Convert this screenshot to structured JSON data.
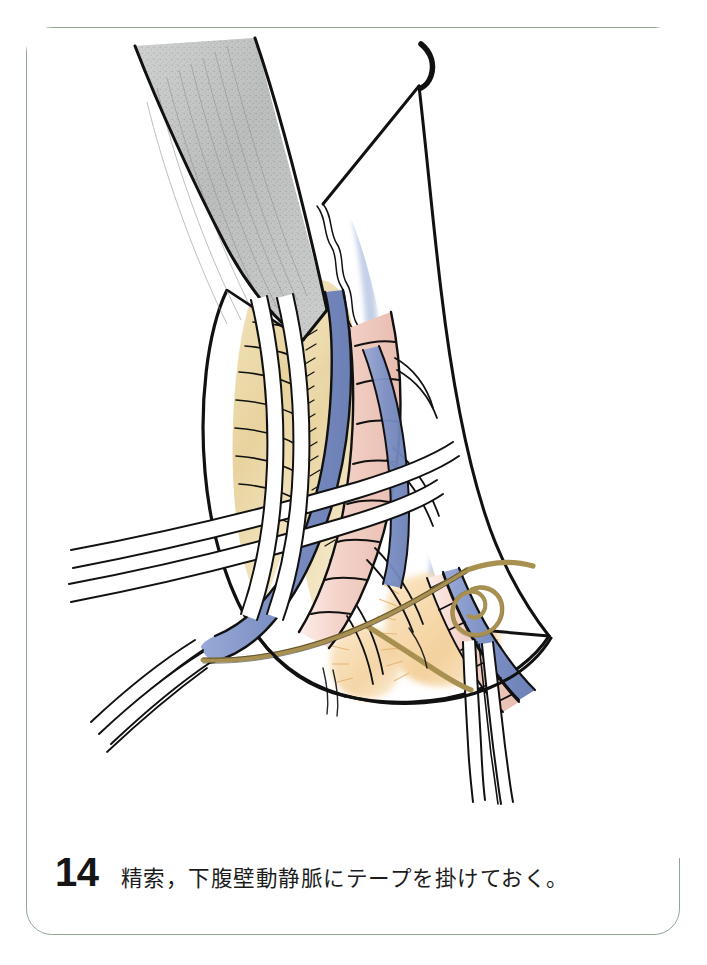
{
  "page": {
    "background_color": "#ffffff",
    "border_color": "#8fa795",
    "card_background": "#ffffff"
  },
  "caption": {
    "number": "14",
    "text": "精索，下腹壁動静脈にテープを掛けておく。"
  },
  "figure": {
    "title": "精索，下腹壁動静脈にテープを掛けておく。",
    "type": "surgical-line-illustration",
    "palette": {
      "ink": "#111111",
      "retractor_gray": "#b9bcbb",
      "retractor_gray_dark": "#8e9290",
      "vein_blue": "#7b8fc4",
      "vein_blue_light": "#a8b8da",
      "edge_blue_wash": "#c3cfe8",
      "artery_pink": "#f3d4cb",
      "artery_pink_deep": "#e8b9ac",
      "muscle_tan": "#ecd9a8",
      "muscle_tan_deep": "#dcc184",
      "fat_orange": "#f5d5a2",
      "tape_white": "#ffffff",
      "tape_olive": "#a89050",
      "tape_olive_light": "#c3ae72"
    },
    "structures": [
      {
        "name": "retractor-blade",
        "label": "鈎（リトラクター）",
        "color": "#b9bcbb"
      },
      {
        "name": "aponeurosis-flap-left",
        "label": "外腹斜筋腱膜（内側翻転）",
        "color": "#ffffff"
      },
      {
        "name": "aponeurosis-flap-right",
        "label": "外腹斜筋腱膜（外側翻転）",
        "color": "#ffffff"
      },
      {
        "name": "internal-oblique-muscle",
        "label": "内腹斜筋・腹横筋",
        "color": "#ecd9a8"
      },
      {
        "name": "spermatic-cord",
        "label": "精索",
        "color": "#f3d4cb"
      },
      {
        "name": "inferior-epigastric-vein",
        "label": "下腹壁静脈",
        "color": "#7b8fc4"
      },
      {
        "name": "inferior-epigastric-artery",
        "label": "下腹壁動脈",
        "color": "#f3d4cb"
      },
      {
        "name": "vessel-tape-white-upper",
        "label": "血管テープ（白・上）",
        "color": "#ffffff"
      },
      {
        "name": "vessel-tape-white-lower",
        "label": "血管テープ（白・下）",
        "color": "#ffffff"
      },
      {
        "name": "vessel-tape-white-right",
        "label": "血管テープ（白・右下）",
        "color": "#ffffff"
      },
      {
        "name": "ligature-olive",
        "label": "結紮糸（オリーブ色）",
        "color": "#a89050"
      },
      {
        "name": "preperitoneal-fat",
        "label": "腹膜前脂肪",
        "color": "#f5d5a2"
      },
      {
        "name": "tick-mark",
        "label": "補助記号",
        "color": "#111111"
      }
    ]
  }
}
